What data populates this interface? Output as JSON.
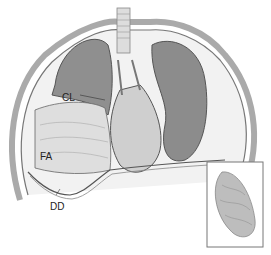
{
  "figure": {
    "labels": [
      {
        "id": "CL",
        "text": "CL"
      },
      {
        "id": "FA",
        "text": "FA"
      },
      {
        "id": "DD",
        "text": "DD"
      }
    ],
    "colors": {
      "tissue_dark": "#8a8a8a",
      "tissue_mid": "#b8b8b8",
      "tissue_light": "#e2e2e2",
      "outline": "#555555",
      "inset_border": "#777777"
    }
  }
}
